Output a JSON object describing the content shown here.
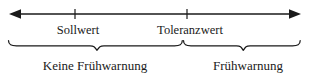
{
  "figure": {
    "type": "number-line-threshold-diagram",
    "language": "de",
    "background_color": "#ffffff",
    "stroke_color": "#1a1a1a",
    "axis": {
      "name": "horizontal-double-arrow-axis",
      "y": 14,
      "x_start": 10,
      "x_end": 300,
      "left_arrowhead": true,
      "right_arrowhead": true
    },
    "ticks": [
      {
        "id": "tick-sollwert",
        "x": 75,
        "label": "Sollwert",
        "label_x": 78,
        "label_y": 24
      },
      {
        "id": "tick-toleranzwert",
        "x": 187,
        "label": "Toleranzwert",
        "label_x": 190,
        "label_y": 24
      }
    ],
    "braces": [
      {
        "id": "brace-keine-fruehwarnung",
        "x_start": 8,
        "x_end": 182,
        "curl_x": 97,
        "top_y": 40,
        "label": "Keine Frühwarnung",
        "label_x": 95,
        "label_y": 59
      },
      {
        "id": "brace-fruehwarnung",
        "x_start": 183,
        "x_end": 300,
        "curl_x": 243,
        "top_y": 40,
        "label": "Frühwarnung",
        "label_x": 248,
        "label_y": 59
      }
    ]
  }
}
